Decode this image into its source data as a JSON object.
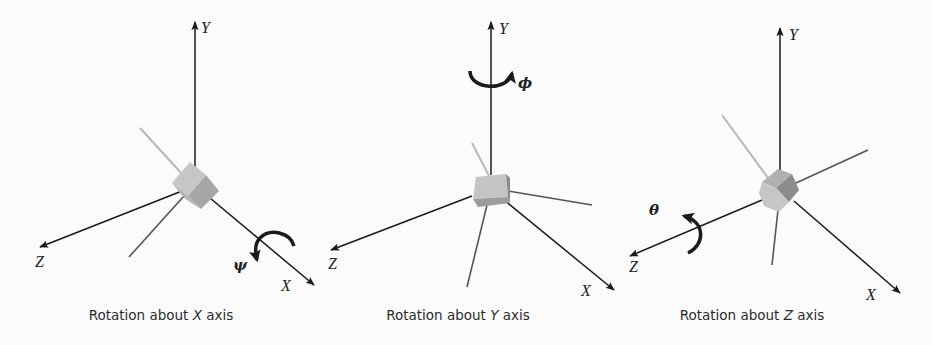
{
  "figure": {
    "panels": [
      {
        "id": "rotation-x",
        "caption_prefix": "Rotation about ",
        "caption_axis": "X",
        "caption_suffix": " axis",
        "axis_labels": {
          "y": "Y",
          "z": "Z",
          "x": "X"
        },
        "rotation_symbol": "ψ",
        "rotation_axis": "X"
      },
      {
        "id": "rotation-y",
        "caption_prefix": "Rotation about ",
        "caption_axis": "Y",
        "caption_suffix": " axis",
        "axis_labels": {
          "y": "Y",
          "z": "Z",
          "x": "X"
        },
        "rotation_symbol": "ϕ",
        "rotation_axis": "Y"
      },
      {
        "id": "rotation-z",
        "caption_prefix": "Rotation about ",
        "caption_axis": "Z",
        "caption_suffix": " axis",
        "axis_labels": {
          "y": "Y",
          "z": "Z",
          "x": "X"
        },
        "rotation_symbol": "θ",
        "rotation_axis": "Z"
      }
    ],
    "colors": {
      "background": "#fbfbfb",
      "axis": "#1a1a1a",
      "rotated_axis_light": "#b8b8b8",
      "rotated_axis_dark": "#555555",
      "cube_light": "#c4c4c4",
      "cube_mid": "#a8a8a8",
      "cube_dark": "#8a8a8a"
    }
  }
}
